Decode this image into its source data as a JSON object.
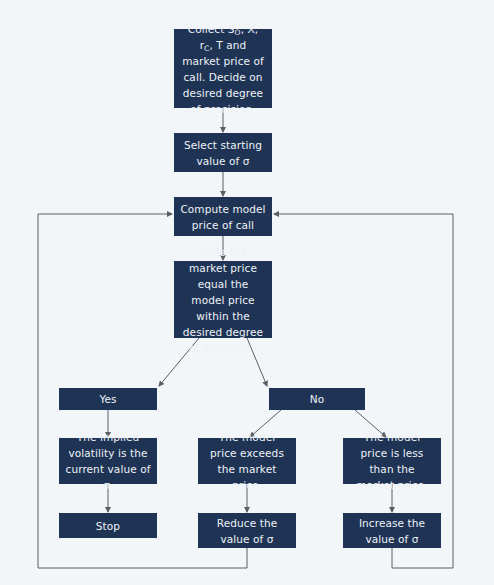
{
  "diagram": {
    "type": "flowchart",
    "colors": {
      "box_fill": "#1f3455",
      "box_text": "#eef2f7",
      "background": "#f3f6f9",
      "connector": "#5a5f66"
    },
    "nodes": {
      "collect": {
        "text_pre": "Collect S",
        "sub_s": "O",
        "text_mid1": ", X, r",
        "sub_r": "C",
        "text_mid2": ", T and market price of call. Decide on desired degree of precision."
      },
      "select": {
        "label": "Select starting value of σ"
      },
      "compute": {
        "label": "Compute model price of call"
      },
      "decision": {
        "label": "Does the market price equal the model price within the desired degree of precision?"
      },
      "yes": {
        "label": "Yes"
      },
      "no": {
        "label": "No"
      },
      "implied": {
        "label": "The implied volatility is the current value of σ."
      },
      "stop": {
        "label": "Stop"
      },
      "exceeds": {
        "label": "The model price exceeds the market price."
      },
      "less": {
        "label": "The model price is less than the market price."
      },
      "reduce": {
        "label": "Reduce the value of σ"
      },
      "increase": {
        "label": "Increase the value of σ"
      }
    },
    "edges": [
      [
        "collect",
        "select"
      ],
      [
        "select",
        "compute"
      ],
      [
        "compute",
        "decision"
      ],
      [
        "decision",
        "yes"
      ],
      [
        "decision",
        "no"
      ],
      [
        "yes",
        "implied"
      ],
      [
        "implied",
        "stop"
      ],
      [
        "no",
        "exceeds"
      ],
      [
        "no",
        "less"
      ],
      [
        "exceeds",
        "reduce"
      ],
      [
        "less",
        "increase"
      ],
      [
        "reduce",
        "compute"
      ],
      [
        "increase",
        "compute"
      ]
    ]
  }
}
